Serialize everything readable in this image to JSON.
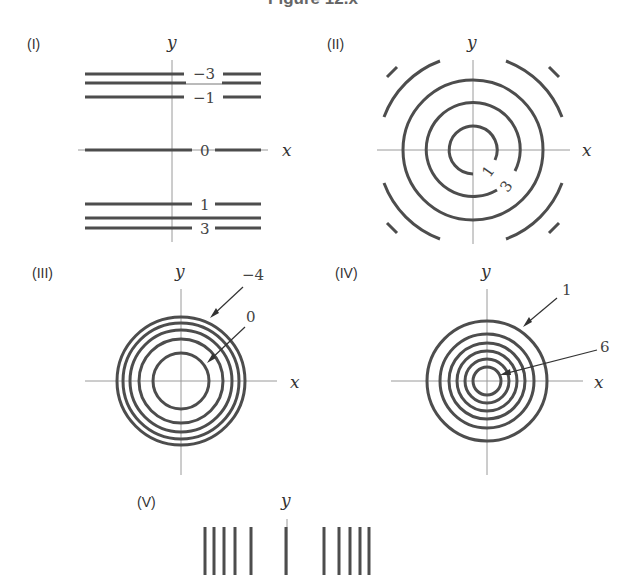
{
  "figure": {
    "title": "Figure 12.x",
    "line_color": "#4d4d4d",
    "axis_color": "#9a9a9a"
  },
  "panels": [
    {
      "id": "I",
      "label": "(I)",
      "axis_x": "x",
      "axis_y": "y",
      "curve_type": "horizontal lines",
      "level_labels": [
        "−3",
        "−1",
        "0",
        "1",
        "3"
      ]
    },
    {
      "id": "II",
      "label": "(II)",
      "axis_x": "x",
      "axis_y": "y",
      "curve_type": "concentric circles with widening spacing",
      "level_labels": [
        "1",
        "3"
      ]
    },
    {
      "id": "III",
      "label": "(III)",
      "axis_x": "x",
      "axis_y": "y",
      "curve_type": "concentric circles, tighter toward outside",
      "level_labels": [
        "−4",
        "0"
      ]
    },
    {
      "id": "IV",
      "label": "(IV)",
      "axis_x": "x",
      "axis_y": "y",
      "curve_type": "concentric circles, evenly spaced",
      "level_labels": [
        "1",
        "6"
      ]
    },
    {
      "id": "V",
      "label": "(V)",
      "axis_y": "y",
      "curve_type": "vertical lines"
    }
  ]
}
